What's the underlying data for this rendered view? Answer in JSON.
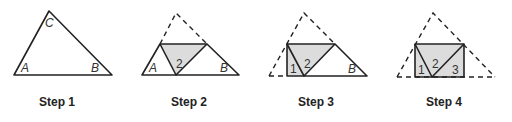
{
  "figure": {
    "steps": [
      {
        "label": "Step 1",
        "vertex_labels": [
          "A",
          "B",
          "C"
        ]
      },
      {
        "label": "Step 2",
        "vertex_labels": [
          "A",
          "2",
          "B"
        ]
      },
      {
        "label": "Step 3",
        "vertex_labels": [
          "1",
          "2",
          "B"
        ]
      },
      {
        "label": "Step 4",
        "vertex_labels": [
          "1",
          "2",
          "3"
        ]
      }
    ],
    "colors": {
      "line": "#222222",
      "shade": "#dcdcdc"
    }
  }
}
